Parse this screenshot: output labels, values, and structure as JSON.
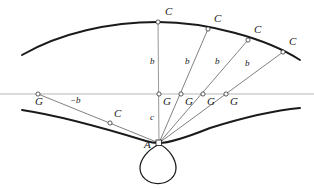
{
  "figure": {
    "width": 314,
    "height": 188,
    "background": "#ffffff",
    "colors": {
      "curve_stroke": "#1a1a1a",
      "ray_stroke": "#3c3c3c",
      "axis_stroke": "#9a9a9a",
      "vertical_stroke": "#8c8c8c",
      "node_fill": "#ffffff",
      "node_stroke": "#1a1a1a",
      "label_color": "#1a1a1a"
    },
    "stroke_widths": {
      "curve": 1.9,
      "ray": 0.65,
      "axis": 0.7,
      "vertical": 0.9,
      "loop": 1.25,
      "node": 0.7
    }
  },
  "axis": {
    "name": "horizontal-axis",
    "y": 94,
    "x_start": 0,
    "x_end": 314
  },
  "curves": {
    "upper_arc": {
      "name": "upper-arc",
      "path": "M 22 55 C 60 33 110 22 158 22 C 206 22 266 38 300 60"
    },
    "lower_arc": {
      "name": "lower-arc",
      "path": "M 22 110 C 62 116 120 133 146 141 C 151 142.6 155 143 159 143 C 168 143 185 138 210 128 C 245 117 278 110 300 108"
    },
    "cusp_loop": {
      "name": "cusp-loop",
      "path": "M 159 144.5 C 147 150 140 160 140 168 C 140 177 148 183.5 158 183.5 C 168 183.5 176 177 176 168 C 176 159 169 149 160 144.5 Z"
    }
  },
  "points": [
    {
      "id": "C0",
      "name": "point-c-apex",
      "label": "C",
      "x": 158,
      "y": 22,
      "label_x": 165,
      "label_y": 6
    },
    {
      "id": "C1",
      "name": "point-c-1",
      "label": "C",
      "x": 208,
      "y": 29,
      "label_x": 214,
      "label_y": 13
    },
    {
      "id": "C2",
      "name": "point-c-2",
      "label": "C",
      "x": 248,
      "y": 40,
      "label_x": 254,
      "label_y": 24
    },
    {
      "id": "C3",
      "name": "point-c-3",
      "label": "C",
      "x": 283,
      "y": 52,
      "label_x": 289,
      "label_y": 36
    },
    {
      "id": "Cl",
      "name": "point-c-left",
      "label": "C",
      "x": 110,
      "y": 123,
      "label_x": 114,
      "label_y": 108
    },
    {
      "id": "G0",
      "name": "point-g-center",
      "label": "G",
      "x": 159,
      "y": 94,
      "label_x": 163,
      "label_y": 96
    },
    {
      "id": "G1",
      "name": "point-g-1",
      "label": "G",
      "x": 181,
      "y": 94,
      "label_x": 185,
      "label_y": 96
    },
    {
      "id": "G2",
      "name": "point-g-2",
      "label": "G",
      "x": 203,
      "y": 94,
      "label_x": 207,
      "label_y": 96
    },
    {
      "id": "G3",
      "name": "point-g-3",
      "label": "G",
      "x": 226,
      "y": 94,
      "label_x": 230,
      "label_y": 96
    },
    {
      "id": "Gl",
      "name": "point-g-left",
      "label": "G",
      "x": 38,
      "y": 94,
      "label_x": 35,
      "label_y": 96
    },
    {
      "id": "A",
      "name": "point-a-cusp",
      "label": "A",
      "x": 159,
      "y": 143,
      "label_x": 144,
      "label_y": 139
    }
  ],
  "rays": [
    {
      "name": "ray-a-to-c-apex",
      "from": "A",
      "to": "C0",
      "x1": 159,
      "y1": 143,
      "x2": 158,
      "y2": 22,
      "vertical": true
    },
    {
      "name": "ray-a-to-c-1",
      "from": "A",
      "to": "C1",
      "x1": 159,
      "y1": 143,
      "x2": 208,
      "y2": 29
    },
    {
      "name": "ray-a-to-c-2",
      "from": "A",
      "to": "C2",
      "x1": 159,
      "y1": 143,
      "x2": 248,
      "y2": 40
    },
    {
      "name": "ray-a-to-c-3",
      "from": "A",
      "to": "C3",
      "x1": 159,
      "y1": 143,
      "x2": 283,
      "y2": 52
    },
    {
      "name": "ray-a-to-g-left",
      "from": "A",
      "to": "Gl",
      "x1": 159,
      "y1": 143,
      "x2": 38,
      "y2": 94
    }
  ],
  "segment_labels": [
    {
      "id": "b0",
      "name": "segment-label-b-0",
      "text": "b",
      "x": 150,
      "y": 57
    },
    {
      "id": "b1",
      "name": "segment-label-b-1",
      "text": "b",
      "x": 185,
      "y": 57
    },
    {
      "id": "b2",
      "name": "segment-label-b-2",
      "text": "b",
      "x": 215,
      "y": 57
    },
    {
      "id": "b3",
      "name": "segment-label-b-3",
      "text": "b",
      "x": 245,
      "y": 59
    },
    {
      "id": "c",
      "name": "segment-label-c",
      "text": "c",
      "x": 150,
      "y": 113
    },
    {
      "id": "nb",
      "name": "segment-label-minus-b",
      "text": "−b",
      "x": 70,
      "y": 96
    }
  ]
}
